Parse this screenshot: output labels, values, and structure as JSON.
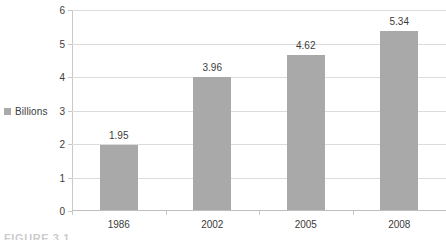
{
  "chart_data": {
    "type": "bar",
    "title": "",
    "subtitle": "",
    "xlabel": "",
    "ylabel": "",
    "categories": [
      "1986",
      "2002",
      "2005",
      "2008"
    ],
    "values": [
      1.95,
      3.96,
      4.62,
      5.34
    ],
    "data_labels": [
      "1.95",
      "3.96",
      "4.62",
      "5.34"
    ],
    "series": [
      {
        "name": "Billions",
        "values": [
          1.95,
          3.96,
          4.62,
          5.34
        ]
      }
    ],
    "ylim": [
      0,
      6
    ],
    "ytick_values": [
      0,
      1,
      2,
      3,
      4,
      5,
      6
    ],
    "ytick_labels": [
      "0",
      "1",
      "2",
      "3",
      "4",
      "5",
      "6"
    ],
    "grid": "horizontal",
    "legend_position": "left",
    "legend_entries": [
      "Billions"
    ],
    "bar_color": "#a9a9a9",
    "gridline_color": "#dcdcdc",
    "axis_color": "#c8c8c8",
    "text_color": "#3b3b3b"
  },
  "legend": {
    "label": "Billions",
    "swatch_color": "#a9a9a9"
  },
  "caption": {
    "text": "FIGURE 3.1"
  }
}
